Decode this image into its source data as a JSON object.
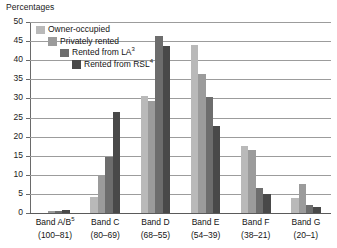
{
  "chart_data": {
    "type": "bar",
    "title": "",
    "ylabel": "Percentages",
    "xlabel": "",
    "ylim": [
      0,
      50
    ],
    "ytick_step": 5,
    "yticks": [
      0,
      5,
      10,
      15,
      20,
      25,
      30,
      35,
      40,
      45,
      50
    ],
    "grid": true,
    "legend_position": "inside-top-left",
    "categories": [
      "Band A/B⁵ (100–81)",
      "Band C (80–69)",
      "Band D (68–55)",
      "Band E (54–39)",
      "Band F (38–21)",
      "Band G (20–1)"
    ],
    "category_names": [
      "Band A/B",
      "Band C",
      "Band D",
      "Band E",
      "Band F",
      "Band G"
    ],
    "category_superscripts": [
      "5",
      "",
      "",
      "",
      "",
      ""
    ],
    "category_ranges": [
      "(100–81)",
      "(80–69)",
      "(68–55)",
      "(54–39)",
      "(38–21)",
      "(20–1)"
    ],
    "series": [
      {
        "name": "Owner-occupied",
        "superscript": "",
        "color": "#b9b9b9",
        "values": [
          0.0,
          4.3,
          30.7,
          44.0,
          17.5,
          3.9
        ]
      },
      {
        "name": "Privately rented",
        "superscript": "",
        "color": "#9b9b9b",
        "values": [
          0.4,
          9.7,
          29.3,
          36.5,
          16.4,
          7.7
        ]
      },
      {
        "name": "Rented from LA",
        "superscript": "3",
        "color": "#6d6d6d",
        "values": [
          0.4,
          14.7,
          46.3,
          30.3,
          6.5,
          2.1
        ]
      },
      {
        "name": "Rented from RSL",
        "superscript": "4",
        "color": "#494949",
        "values": [
          0.8,
          26.5,
          43.6,
          22.8,
          4.9,
          1.6
        ]
      }
    ]
  },
  "axis": {
    "y_title": "Percentages",
    "y_tick_labels": [
      "50",
      "45",
      "40",
      "35",
      "30",
      "25",
      "20",
      "15",
      "10",
      "5",
      "0"
    ]
  },
  "legend": {
    "items": [
      {
        "label": "Owner-occupied",
        "sup": ""
      },
      {
        "label": "Privately rented",
        "sup": ""
      },
      {
        "label": "Rented from LA",
        "sup": "3"
      },
      {
        "label": "Rented from RSL",
        "sup": "4"
      }
    ]
  },
  "colors": {
    "series_0": "#b9b9b9",
    "series_1": "#9b9b9b",
    "series_2": "#6d6d6d",
    "series_3": "#494949",
    "gridline": "#9c9c9c",
    "axis": "#6a6a6a",
    "text": "#141414",
    "background": "#ffffff"
  }
}
